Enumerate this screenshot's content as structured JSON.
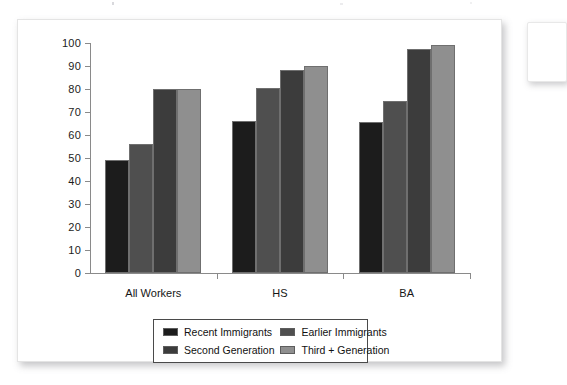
{
  "figure": {
    "card_label": "bar-chart-figure",
    "background": "#ffffff"
  },
  "chart_data": {
    "type": "bar",
    "title": "",
    "subtitle": "",
    "xlabel": "",
    "ylabel": "",
    "ylim": [
      0,
      100
    ],
    "ytick_step": 10,
    "yticks": [
      "0",
      "10",
      "20",
      "30",
      "40",
      "50",
      "60",
      "70",
      "80",
      "90",
      "100"
    ],
    "grid": false,
    "legend_position": "bottom",
    "categories": [
      "All Workers",
      "HS",
      "BA"
    ],
    "series": [
      {
        "name": "Recent Immigrants",
        "color": "#1c1c1c",
        "values": [
          49,
          66,
          65.5
        ]
      },
      {
        "name": "Earlier Immigrants",
        "color": "#4f4f4f",
        "values": [
          56.3,
          80.5,
          75
        ]
      },
      {
        "name": "Second Generation",
        "color": "#3c3c3c",
        "values": [
          79.8,
          88.3,
          97.2
        ]
      },
      {
        "name": "Third + Generation",
        "color": "#8f8f8f",
        "values": [
          80,
          90,
          99.3
        ]
      }
    ]
  },
  "legend": {
    "items": [
      {
        "label": "Recent Immigrants",
        "color": "#1c1c1c"
      },
      {
        "label": "Earlier Immigrants",
        "color": "#4f4f4f"
      },
      {
        "label": "Second Generation",
        "color": "#3c3c3c"
      },
      {
        "label": "Third + Generation",
        "color": "#8f8f8f"
      }
    ]
  }
}
